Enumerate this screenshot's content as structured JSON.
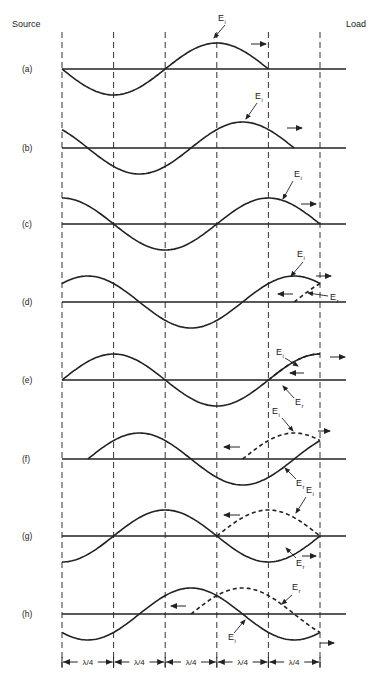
{
  "header": {
    "source_label": "Source",
    "load_label": "Load"
  },
  "geometry": {
    "x_start": 62,
    "quarter": 51.6,
    "amplitude": 26,
    "guides_x": [
      62,
      113.6,
      165.2,
      216.8,
      268.4,
      320
    ],
    "axis_x_end": 346,
    "guide_y_top": 32,
    "guide_y_bottom": 672
  },
  "symbols": {
    "incident": "E",
    "incident_sub": "i",
    "reflected": "E",
    "reflected_sub": "r"
  },
  "rows": [
    {
      "label": "(a)",
      "y": 69,
      "incident": {
        "phase_deg": 180,
        "from": 62,
        "to": 268.4
      },
      "reflected": null,
      "ei_label": {
        "x": 218,
        "y": 21,
        "ptr": [
          225,
          25,
          214,
          38
        ]
      },
      "er_label": null,
      "arrows": [
        {
          "x1": 251,
          "x2": 266,
          "y": 44,
          "dir": "right"
        }
      ]
    },
    {
      "label": "(b)",
      "y": 148,
      "incident": {
        "phase_deg": 135,
        "from": 62,
        "to": 294.2
      },
      "reflected": null,
      "ei_label": {
        "x": 255,
        "y": 99,
        "ptr": [
          257,
          103,
          246,
          119
        ]
      },
      "er_label": null,
      "arrows": [
        {
          "x1": 287,
          "x2": 302,
          "y": 128,
          "dir": "right"
        }
      ]
    },
    {
      "label": "(c)",
      "y": 224,
      "incident": {
        "phase_deg": 90,
        "from": 62,
        "to": 320
      },
      "reflected": null,
      "ei_label": {
        "x": 294,
        "y": 177,
        "ptr": [
          293,
          181,
          283,
          199
        ]
      },
      "er_label": null,
      "arrows": [
        {
          "x1": 301,
          "x2": 316,
          "y": 204,
          "dir": "right"
        }
      ]
    },
    {
      "label": "(d)",
      "y": 302,
      "incident": {
        "phase_deg": 45,
        "from": 62,
        "to": 320
      },
      "reflected": {
        "phase_deg": 45,
        "from": 294.2,
        "to": 320,
        "mirror": true
      },
      "ei_label": {
        "x": 297,
        "y": 257,
        "ptr": [
          303,
          262,
          291,
          276
        ]
      },
      "er_label": {
        "x": 330,
        "y": 300,
        "ptr": [
          328,
          296,
          308,
          293
        ]
      },
      "arrows": [
        {
          "x1": 316,
          "x2": 331,
          "y": 276,
          "dir": "right"
        },
        {
          "x1": 293,
          "x2": 278,
          "y": 294,
          "dir": "left"
        }
      ]
    },
    {
      "label": "(e)",
      "y": 380,
      "incident": {
        "phase_deg": 0,
        "from": 62,
        "to": 320
      },
      "reflected": {
        "phase_deg": 0,
        "from": 268.4,
        "to": 320,
        "mirror": true
      },
      "ei_label": {
        "x": 276,
        "y": 355,
        "ptr": [
          285,
          358,
          298,
          366
        ]
      },
      "er_label": {
        "x": 295,
        "y": 405,
        "ptr": [
          294,
          398,
          283,
          386
        ]
      },
      "arrows": [
        {
          "x1": 330,
          "x2": 345,
          "y": 357,
          "dir": "right"
        },
        {
          "x1": 304,
          "x2": 290,
          "y": 373,
          "dir": "left"
        }
      ]
    },
    {
      "label": "(f)",
      "y": 459,
      "incident": {
        "phase_deg": -45,
        "from": 87.8,
        "to": 320
      },
      "reflected": {
        "phase_deg": -45,
        "from": 242.6,
        "to": 320,
        "mirror": true
      },
      "ei_label": {
        "x": 272,
        "y": 414,
        "ptr": [
          282,
          418,
          293,
          431
        ]
      },
      "er_label": {
        "x": 296,
        "y": 486,
        "ptr": [
          296,
          479,
          285,
          468
        ]
      },
      "arrows": [
        {
          "x1": 318,
          "x2": 330,
          "y": 431,
          "dir": "right"
        },
        {
          "x1": 240,
          "x2": 224,
          "y": 447,
          "dir": "left"
        }
      ]
    },
    {
      "label": "(g)",
      "y": 536,
      "incident": {
        "phase_deg": -90,
        "from": 62,
        "to": 320
      },
      "reflected": {
        "phase_deg": -90,
        "from": 216.8,
        "to": 320,
        "mirror": true
      },
      "ei_label": {
        "x": 306,
        "y": 493,
        "ptr": [
          306,
          497,
          296,
          513
        ]
      },
      "er_label": {
        "x": 296,
        "y": 566,
        "ptr": [
          296,
          558,
          286,
          548
        ]
      },
      "arrows": [
        {
          "x1": 302,
          "x2": 316,
          "y": 556,
          "dir": "right"
        },
        {
          "x1": 240,
          "x2": 224,
          "y": 515,
          "dir": "left"
        }
      ]
    },
    {
      "label": "(h)",
      "y": 614,
      "incident": {
        "phase_deg": -135,
        "from": 62,
        "to": 320
      },
      "reflected": {
        "phase_deg": -135,
        "from": 191,
        "to": 320,
        "mirror": true
      },
      "ei_label": {
        "x": 228,
        "y": 640,
        "ptr": [
          234,
          633,
          245,
          620
        ]
      },
      "er_label": {
        "x": 292,
        "y": 590,
        "ptr": [
          292,
          595,
          282,
          604
        ]
      },
      "arrows": [
        {
          "x1": 320,
          "x2": 334,
          "y": 643,
          "dir": "right"
        },
        {
          "x1": 186,
          "x2": 171,
          "y": 606,
          "dir": "left"
        }
      ]
    }
  ],
  "dimension_row": {
    "y": 662,
    "labels": [
      "λ/4",
      "λ/4",
      "λ/4",
      "λ/4",
      "λ/4"
    ]
  }
}
